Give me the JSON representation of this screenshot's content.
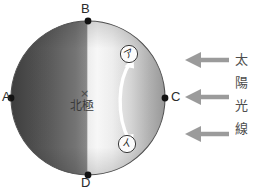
{
  "figure": {
    "background_color": "#ffffff"
  },
  "globe": {
    "center_label_symbol": "×",
    "center_label_text": "北極",
    "lit_side_color": "#fbfbfb",
    "dark_side_color": "#4a4a4a",
    "outline_color": "#555555",
    "cardinal_points": [
      {
        "id": "B",
        "label": "B",
        "position": "top",
        "dot_color": "#121212"
      },
      {
        "id": "A",
        "label": "A",
        "position": "left",
        "dot_color": "#121212"
      },
      {
        "id": "C",
        "label": "C",
        "position": "right",
        "dot_color": "#121212"
      },
      {
        "id": "D",
        "label": "D",
        "position": "bottom",
        "dot_color": "#121212"
      }
    ],
    "markers": [
      {
        "id": "a",
        "label": "ア",
        "position": "upper-right",
        "style": "circled-white"
      },
      {
        "id": "i",
        "label": "イ",
        "position": "lower-right",
        "style": "circled-white"
      }
    ],
    "rotation_arrow": {
      "color": "#ffffff",
      "heads": "double",
      "description": "curved double-headed arrow between ア and イ"
    }
  },
  "sunlight": {
    "arrow_color": "#999999",
    "arrow_direction": "left",
    "arrow_count": 3,
    "caption_characters": [
      "太",
      "陽",
      "光",
      "線"
    ],
    "caption_text": "太陽光線"
  }
}
